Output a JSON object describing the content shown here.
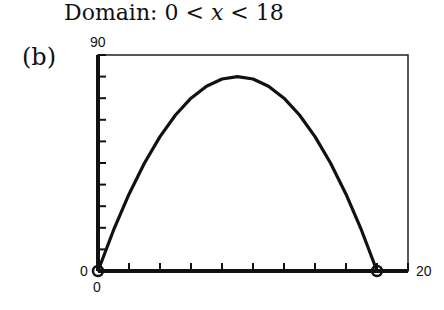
{
  "header": {
    "title_prefix": "Domain: 0 < ",
    "title_var": "x",
    "title_suffix": " < 18",
    "part_label": "(b)"
  },
  "chart_data": {
    "type": "line",
    "title": "Domain: 0 < x < 18",
    "part": "(b)",
    "xlabel": "",
    "ylabel": "",
    "xlim": [
      0,
      20
    ],
    "ylim": [
      0,
      90
    ],
    "x_tick_labels": {
      "min": "0",
      "max": "20"
    },
    "y_tick_labels": {
      "min": "0",
      "max": "90"
    },
    "x_tick_step": 2,
    "y_tick_step": 9,
    "grid": false,
    "series": [
      {
        "name": "f(x) = x(18 - x)",
        "x": [
          0,
          1,
          2,
          3,
          4,
          5,
          6,
          7,
          8,
          9,
          10,
          11,
          12,
          13,
          14,
          15,
          16,
          17,
          18
        ],
        "y": [
          0,
          17,
          32,
          45,
          56,
          65,
          72,
          77,
          80,
          81,
          80,
          77,
          72,
          65,
          56,
          45,
          32,
          17,
          0
        ]
      }
    ],
    "endpoint_markers": [
      {
        "x": 0,
        "y": 0,
        "style": "open-circle"
      },
      {
        "x": 18,
        "y": 0,
        "style": "open-circle"
      }
    ]
  },
  "colors": {
    "line": "#111111",
    "frame": "#222222",
    "background": "#ffffff"
  }
}
